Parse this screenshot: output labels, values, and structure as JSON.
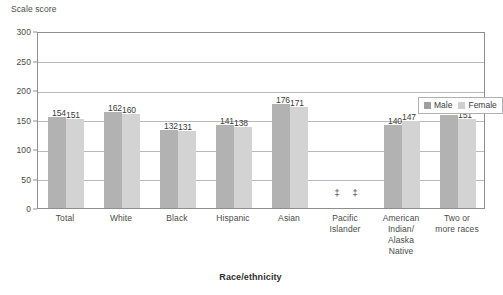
{
  "chart_data": {
    "type": "bar",
    "title": "",
    "ylabel": "Scale score",
    "xlabel": "Race/ethnicity",
    "ylim": [
      0,
      300
    ],
    "yticks": [
      0,
      50,
      100,
      150,
      200,
      250,
      300
    ],
    "ytick_labels": [
      "0",
      "50",
      "100",
      "150",
      "200",
      "250",
      "300"
    ],
    "grid": true,
    "legend_position": "top-right-inside",
    "categories": [
      "Total",
      "White",
      "Black",
      "Hispanic",
      "Asian",
      "Pacific\nIslander",
      "American\nIndian/\nAlaska\nNative",
      "Two or\nmore races"
    ],
    "series": [
      {
        "name": "Male",
        "color": "#b2b2b2",
        "values": [
          154,
          162,
          132,
          141,
          176,
          null,
          140,
          157
        ],
        "labels": [
          "154",
          "162",
          "132",
          "141",
          "176",
          "‡",
          "140",
          "157"
        ]
      },
      {
        "name": "Female",
        "color": "#d3d3d3",
        "values": [
          151,
          160,
          131,
          138,
          171,
          null,
          147,
          151
        ],
        "labels": [
          "151",
          "160",
          "131",
          "138",
          "171",
          "‡",
          "147",
          "151"
        ]
      }
    ],
    "suppressed_marker": "‡",
    "suppressed_categories": [
      "Pacific\nIslander"
    ]
  },
  "legend": {
    "items": [
      {
        "label": "Male",
        "color": "#b2b2b2"
      },
      {
        "label": "Female",
        "color": "#d3d3d3"
      }
    ]
  }
}
